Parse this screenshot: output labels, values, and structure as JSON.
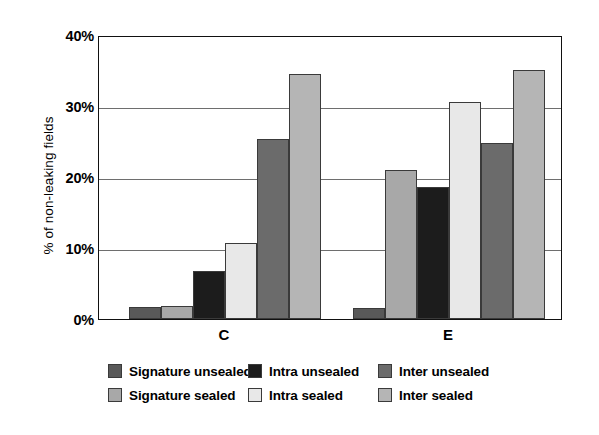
{
  "chart_data": {
    "type": "bar",
    "title": "",
    "xlabel": "",
    "ylabel": "% of non-leaking fields",
    "categories": [
      "C",
      "E"
    ],
    "ylim": [
      0,
      40
    ],
    "ytick_labels": [
      "0%",
      "10%",
      "20%",
      "30%",
      "40%"
    ],
    "ytick_values": [
      0,
      10,
      20,
      30,
      40
    ],
    "grid": "horizontal",
    "legend_position": "bottom",
    "series": [
      {
        "name": "Signature unsealed",
        "color": "#595959",
        "values": [
          1.7,
          1.5
        ]
      },
      {
        "name": "Signature sealed",
        "color": "#a8a8a8",
        "values": [
          1.9,
          21.0
        ]
      },
      {
        "name": "Intra unsealed",
        "color": "#1c1c1c",
        "values": [
          6.8,
          18.6
        ]
      },
      {
        "name": "Intra sealed",
        "color": "#e8e8e8",
        "values": [
          10.7,
          30.6
        ]
      },
      {
        "name": "Inter unsealed",
        "color": "#6b6b6b",
        "values": [
          25.4,
          24.8
        ]
      },
      {
        "name": "Inter sealed",
        "color": "#b5b5b5",
        "values": [
          34.5,
          35.1
        ]
      }
    ]
  },
  "axis": {
    "y_title": "% of non-leaking fields",
    "y_labels": [
      "40%",
      "30%",
      "20%",
      "10%",
      "0%"
    ],
    "x_labels": [
      "C",
      "E"
    ]
  },
  "legend": {
    "items": [
      {
        "label": "Signature unsealed",
        "color": "#595959"
      },
      {
        "label": "Signature sealed",
        "color": "#a8a8a8"
      },
      {
        "label": "Intra unsealed",
        "color": "#1c1c1c"
      },
      {
        "label": "Intra sealed",
        "color": "#e8e8e8"
      },
      {
        "label": "Inter unsealed",
        "color": "#6b6b6b"
      },
      {
        "label": "Inter sealed",
        "color": "#b5b5b5"
      }
    ]
  }
}
